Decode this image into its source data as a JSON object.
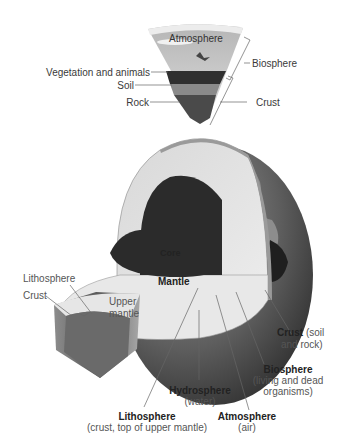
{
  "diagram": {
    "wedge_labels": {
      "atmosphere": "Atmosphere",
      "biosphere": "Biosphere",
      "vegetation": "Vegetation and animals",
      "soil": "Soil",
      "rock": "Rock",
      "crust": "Crust"
    },
    "globe_labels": {
      "core": "Core",
      "mantle": "Mantle",
      "lithosphere_small": "Lithosphere",
      "crust_small": "Crust",
      "upper_mantle_1": "Upper",
      "upper_mantle_2": "mantle"
    },
    "bottom_labels": {
      "crust": {
        "title": "Crust",
        "note_inline": "(soil",
        "note_line2": "and rock)"
      },
      "biosphere": {
        "title": "Biosphere",
        "note_line1": "(living and dead",
        "note_line2": "organisms)"
      },
      "hydrosphere": {
        "title": "Hydrosphere",
        "note": "(water)"
      },
      "atmosphere": {
        "title": "Atmosphere",
        "note": "(air)"
      },
      "lithosphere": {
        "title": "Lithosphere",
        "note": "(crust, top of upper mantle)"
      }
    },
    "colors": {
      "core": "#2b2b2b",
      "mantle": "#e4e4e4",
      "globe_surface": "#5a5a5a",
      "land": "#8a8a8a",
      "sky": "#c9c9c9",
      "leader_line": "#666666"
    }
  }
}
